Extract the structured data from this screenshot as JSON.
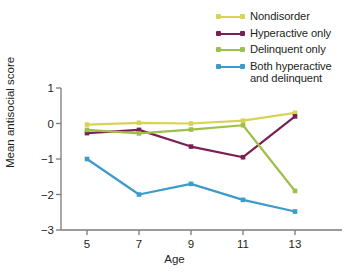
{
  "chart_data": {
    "type": "line",
    "title": "",
    "xlabel": "Age",
    "ylabel": "Mean antisocial score",
    "x": [
      5,
      7,
      9,
      11,
      13
    ],
    "xtick_labels": [
      "5",
      "7",
      "9",
      "11",
      "13"
    ],
    "ytick_labels": [
      "1",
      "0",
      "−1",
      "−2",
      "−3"
    ],
    "ytick_values": [
      1,
      0,
      -1,
      -2,
      -3
    ],
    "xlim": [
      4,
      14
    ],
    "ylim": [
      -3,
      1
    ],
    "grid": false,
    "legend_position": "top-right",
    "markers": true,
    "series": [
      {
        "name": "Nondisorder",
        "color": "#d8d255",
        "values": [
          -0.03,
          0.02,
          0.0,
          0.08,
          0.3
        ]
      },
      {
        "name": "Hyperactive only",
        "color": "#7b1e52",
        "values": [
          -0.27,
          -0.18,
          -0.65,
          -0.95,
          0.2
        ]
      },
      {
        "name": "Delinquent only",
        "color": "#9dc04b",
        "values": [
          -0.18,
          -0.28,
          -0.17,
          -0.05,
          -1.9
        ]
      },
      {
        "name": "Both hyperactive\nand delinquent",
        "color": "#3d9bc9",
        "values": [
          -1.0,
          -2.0,
          -1.7,
          -2.15,
          -2.48
        ]
      }
    ]
  },
  "axis": {
    "line_color": "#7a7a7a",
    "text_color": "#231f20"
  }
}
